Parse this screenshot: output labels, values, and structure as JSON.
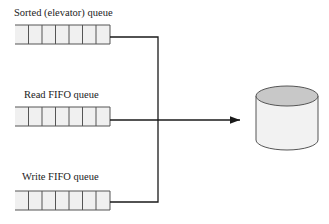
{
  "diagram": {
    "queues": [
      {
        "label": "Sorted (elevator) queue",
        "slots": 7
      },
      {
        "label": "Read FIFO queue",
        "slots": 7
      },
      {
        "label": "Write FIFO queue",
        "slots": 7
      }
    ],
    "target": "disk-cylinder",
    "colors": {
      "line": "#1a1a1a",
      "queue_fill": "#f0f0f0",
      "queue_border": "#555555",
      "disk_top": "#c8c8c8",
      "disk_body": "#f2f2f2"
    }
  }
}
